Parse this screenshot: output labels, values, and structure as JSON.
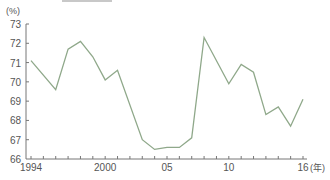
{
  "chart_data": {
    "type": "line",
    "title": "",
    "xlabel": "(年)",
    "ylabel": "(%)",
    "ylim": [
      66,
      73
    ],
    "xlim": [
      1994,
      2016
    ],
    "grid": false,
    "legend": null,
    "line_color": "#8fa88a",
    "axis_color": "#777777",
    "y_ticks": [
      {
        "value": 66,
        "label": "66"
      },
      {
        "value": 67,
        "label": "67"
      },
      {
        "value": 68,
        "label": "68"
      },
      {
        "value": 69,
        "label": "69"
      },
      {
        "value": 70,
        "label": "70"
      },
      {
        "value": 71,
        "label": "71"
      },
      {
        "value": 72,
        "label": "72"
      },
      {
        "value": 73,
        "label": "73"
      }
    ],
    "x_ticks": [
      1994,
      1995,
      1996,
      1997,
      1998,
      1999,
      2000,
      2001,
      2002,
      2003,
      2004,
      2005,
      2006,
      2007,
      2008,
      2009,
      2010,
      2011,
      2012,
      2013,
      2014,
      2015,
      2016
    ],
    "x_tick_labels": [
      {
        "value": 1994,
        "label": "1994"
      },
      {
        "value": 2000,
        "label": "2000"
      },
      {
        "value": 2005,
        "label": "05"
      },
      {
        "value": 2010,
        "label": "10"
      },
      {
        "value": 2016,
        "label": "16"
      }
    ],
    "series": [
      {
        "name": "rate",
        "x": [
          1994,
          1996,
          1997,
          1998,
          1999,
          2000,
          2001,
          2003,
          2004,
          2005,
          2006,
          2007,
          2008,
          2010,
          2011,
          2012,
          2013,
          2014,
          2015,
          2016
        ],
        "values": [
          71.1,
          69.6,
          71.7,
          72.1,
          71.3,
          70.1,
          70.6,
          67.0,
          66.5,
          66.6,
          66.6,
          67.1,
          72.3,
          69.9,
          70.9,
          70.5,
          68.3,
          68.7,
          67.7,
          69.1
        ]
      }
    ]
  }
}
